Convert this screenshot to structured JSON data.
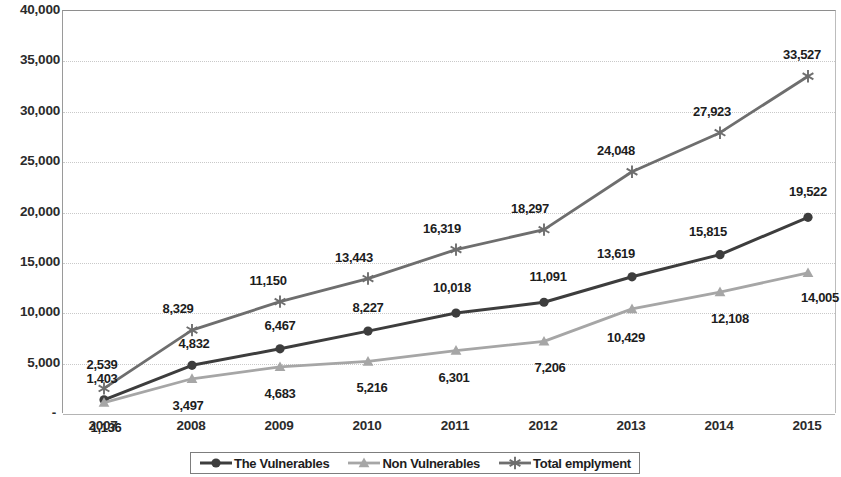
{
  "chart_data": {
    "type": "line",
    "title": "",
    "xlabel": "",
    "ylabel": "",
    "x": [
      2007,
      2008,
      2009,
      2010,
      2011,
      2012,
      2013,
      2014,
      2015
    ],
    "categories": [
      "2007",
      "2008",
      "2009",
      "2010",
      "2011",
      "2012",
      "2013",
      "2014",
      "2015"
    ],
    "ylim": [
      0,
      40000
    ],
    "ytick_values": [
      0,
      5000,
      10000,
      15000,
      20000,
      25000,
      30000,
      35000,
      40000
    ],
    "ytick_labels": [
      "-",
      "5,000",
      "10,000",
      "15,000",
      "20,000",
      "25,000",
      "30,000",
      "35,000",
      "40,000"
    ],
    "grid": true,
    "grid_axis": "y",
    "legend_position": "bottom",
    "series": [
      {
        "name": "The Vulnerables",
        "color": "#3d3d3d",
        "marker": "circle",
        "values": [
          1403,
          4832,
          6467,
          8227,
          10018,
          11091,
          13619,
          15815,
          19522
        ],
        "labels": [
          "1,403",
          "4,832",
          "6,467",
          "8,227",
          "10,018",
          "11,091",
          "13,619",
          "15,815",
          "19,522"
        ]
      },
      {
        "name": "Non Vulnerables",
        "color": "#a6a6a6",
        "marker": "triangle",
        "values": [
          1136,
          3497,
          4683,
          5216,
          6301,
          7206,
          10429,
          12108,
          14005
        ],
        "labels": [
          "1,136",
          "3,497",
          "4,683",
          "5,216",
          "6,301",
          "7,206",
          "10,429",
          "12,108",
          "14,005"
        ]
      },
      {
        "name": "Total emplyment",
        "color": "#6e6e6e",
        "marker": "asterisk",
        "values": [
          2539,
          8329,
          11150,
          13443,
          16319,
          18297,
          24048,
          27923,
          33527
        ],
        "labels": [
          "2,539",
          "8,329",
          "11,150",
          "13,443",
          "16,319",
          "18,297",
          "24,048",
          "27,923",
          "33,527"
        ]
      }
    ]
  },
  "legend": {
    "items": [
      {
        "label": "The Vulnerables"
      },
      {
        "label": "Non Vulnerables"
      },
      {
        "label": "Total emplyment"
      }
    ]
  }
}
